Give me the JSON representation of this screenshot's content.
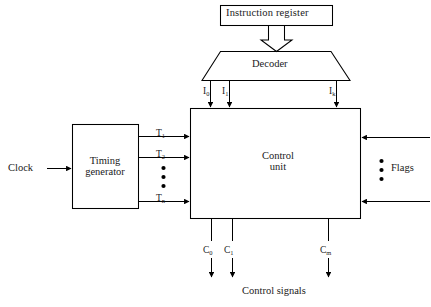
{
  "figure": {
    "background_color": "#ffffff",
    "stroke_color": "#000000",
    "text_color": "#1a1a1a"
  },
  "blocks": {
    "instruction_register": {
      "label": "Instruction register",
      "shape": "rectangle"
    },
    "decoder": {
      "label": "Decoder",
      "shape": "trapezoid"
    },
    "control_unit": {
      "label_line1": "Control",
      "label_line2": "unit",
      "shape": "rectangle"
    },
    "timing_generator": {
      "label_line1": "Timing",
      "label_line2": "generator",
      "shape": "rectangle"
    }
  },
  "inputs": {
    "clock": "Clock",
    "flags": "Flags"
  },
  "outputs": {
    "control_signals": "Control signals"
  },
  "decoder_outputs": [
    {
      "base": "I",
      "sub": "0"
    },
    {
      "base": "I",
      "sub": "1"
    },
    {
      "base": "I",
      "sub": "k"
    }
  ],
  "timing_outputs": [
    {
      "base": "T",
      "sub": "1"
    },
    {
      "base": "T",
      "sub": "2"
    },
    {
      "base": "T",
      "sub": "n"
    }
  ],
  "control_outputs": [
    {
      "base": "C",
      "sub": "0"
    },
    {
      "base": "C",
      "sub": "1"
    },
    {
      "base": "C",
      "sub": "m"
    }
  ],
  "ellipses": {
    "timing_dots": "3 vertical dots between T2 and Tn",
    "flags_dots": "3 vertical dots between flag arrows"
  }
}
